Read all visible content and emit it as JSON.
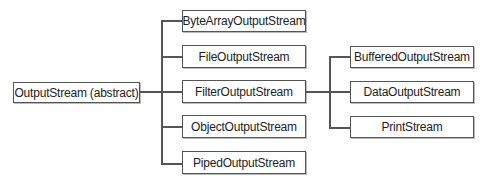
{
  "diagram": {
    "root": {
      "label": "OutputStream (abstract)"
    },
    "children": [
      {
        "label": "ByteArrayOutputStream"
      },
      {
        "label": "FileOutputStream"
      },
      {
        "label": "FilterOutputStream"
      },
      {
        "label": "ObjectOutputStream"
      },
      {
        "label": "PipedOutputStream"
      }
    ],
    "filter_children": [
      {
        "label": "BufferedOutputStream"
      },
      {
        "label": "DataOutputStream"
      },
      {
        "label": "PrintStream"
      }
    ],
    "colors": {
      "line": "#555555",
      "background": "#ffffff",
      "text": "#222222"
    }
  }
}
